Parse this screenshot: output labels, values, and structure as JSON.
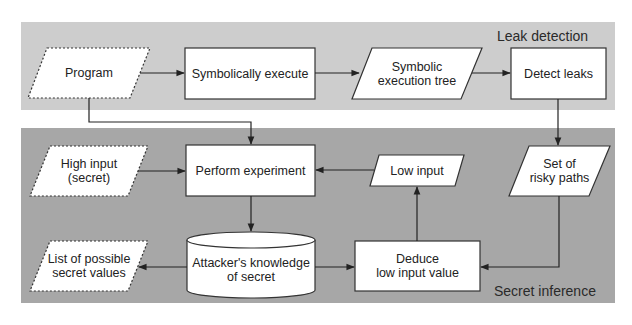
{
  "panels": {
    "top": {
      "label": "Leak detection",
      "color": "#cdcdcd"
    },
    "bottom": {
      "label": "Secret inference",
      "color": "#a7a7a7"
    }
  },
  "nodes": {
    "program": {
      "label": "Program",
      "shape": "parallelogram-dashed"
    },
    "symbolically_execute": {
      "label": "Symbolically execute",
      "shape": "rectangle"
    },
    "symbolic_tree": {
      "line1": "Symbolic",
      "line2": "execution tree",
      "shape": "parallelogram"
    },
    "detect_leaks": {
      "label": "Detect leaks",
      "shape": "rectangle"
    },
    "high_input": {
      "line1": "High input",
      "line2": "(secret)",
      "shape": "parallelogram-dashed"
    },
    "perform_experiment": {
      "label": "Perform experiment",
      "shape": "rectangle"
    },
    "low_input": {
      "label": "Low input",
      "shape": "parallelogram"
    },
    "risky_paths": {
      "line1": "Set of",
      "line2": "risky paths",
      "shape": "parallelogram"
    },
    "possible_values": {
      "line1": "List of possible",
      "line2": "secret values",
      "shape": "parallelogram-dashed"
    },
    "knowledge": {
      "line1": "Attacker's knowledge",
      "line2": "of secret",
      "shape": "cylinder"
    },
    "deduce": {
      "line1": "Deduce",
      "line2": "low input value",
      "shape": "rectangle"
    }
  },
  "edges": [
    {
      "from": "Program",
      "to": "Symbolically execute"
    },
    {
      "from": "Symbolically execute",
      "to": "Symbolic execution tree"
    },
    {
      "from": "Symbolic execution tree",
      "to": "Detect leaks"
    },
    {
      "from": "Detect leaks",
      "to": "Set of risky paths"
    },
    {
      "from": "Program",
      "to": "Perform experiment"
    },
    {
      "from": "High input (secret)",
      "to": "Perform experiment"
    },
    {
      "from": "Low input",
      "to": "Perform experiment"
    },
    {
      "from": "Perform experiment",
      "to": "Attacker's knowledge of secret"
    },
    {
      "from": "Attacker's knowledge of secret",
      "to": "List of possible secret values"
    },
    {
      "from": "Attacker's knowledge of secret",
      "to": "Deduce low input value"
    },
    {
      "from": "Set of risky paths",
      "to": "Deduce low input value"
    },
    {
      "from": "Deduce low input value",
      "to": "Low input"
    }
  ]
}
